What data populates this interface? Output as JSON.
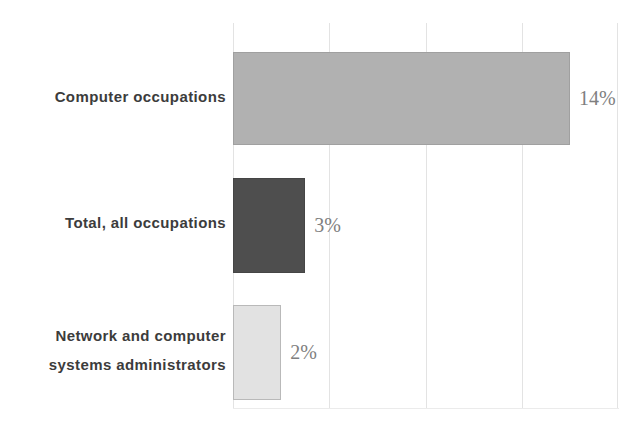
{
  "chart_data": {
    "type": "bar",
    "orientation": "horizontal",
    "title": "",
    "xlabel": "",
    "ylabel": "",
    "categories": [
      "Computer occupations",
      "Total, all occupations",
      "Network and computer systems administrators"
    ],
    "category_lines": [
      [
        "Computer occupations"
      ],
      [
        "Total, all occupations"
      ],
      [
        "Network and computer",
        "systems administrators"
      ]
    ],
    "values": [
      14,
      3,
      2
    ],
    "value_labels": [
      "14%",
      "3%",
      "2%"
    ],
    "xlim": [
      0,
      16
    ],
    "gridline_interval": 4,
    "grid": true,
    "legend_position": "none",
    "bar_colors": [
      "#b1b1b1",
      "#4e4e4e",
      "#e2e2e2"
    ],
    "bar_border_colors": [
      "#a0a0a0",
      "#454545",
      "#b9b9b9"
    ],
    "gridline_color": "#e3e3e3",
    "axis_line_color": "#ebebeb",
    "category_label_color": "#3c3c3c",
    "value_label_color": "#7f7f7f"
  }
}
